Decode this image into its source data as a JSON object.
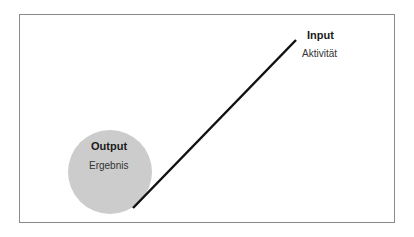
{
  "diagram": {
    "input": {
      "title": "Input",
      "subtitle": "Aktivität"
    },
    "output": {
      "title": "Output",
      "subtitle": "Ergebnis"
    },
    "colors": {
      "circle": "#cccccc",
      "line": "#111111",
      "frame": "#8a8a8a"
    }
  }
}
